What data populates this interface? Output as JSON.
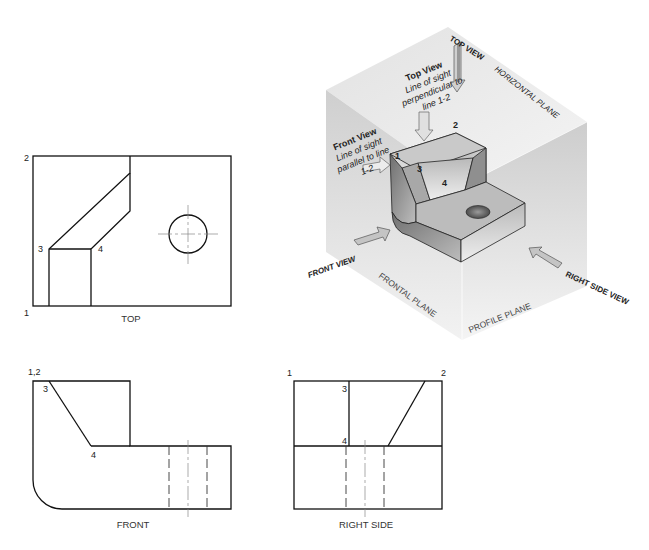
{
  "views": {
    "top": {
      "caption": "TOP",
      "points": {
        "p1": "1",
        "p2": "2",
        "p3": "3",
        "p4": "4"
      }
    },
    "front": {
      "caption": "FRONT",
      "points": {
        "p12": "1,2",
        "p3": "3",
        "p4": "4"
      }
    },
    "right_side": {
      "caption": "RIGHT SIDE",
      "points": {
        "p1": "1",
        "p2": "2",
        "p3": "3",
        "p4": "4"
      }
    }
  },
  "pictorial": {
    "top_view_note": {
      "title": "Top View",
      "lines": [
        "Line of sight",
        "perpendicular to",
        "line 1-2"
      ]
    },
    "front_view_note": {
      "title": "Front View",
      "lines": [
        "Line of sight",
        "parallel to line",
        "1-2"
      ]
    },
    "labels": {
      "top_view": "TOP VIEW",
      "horizontal_plane": "HORIZONTAL PLANE",
      "front_view": "FRONT VIEW",
      "frontal_plane": "FRONTAL PLANE",
      "profile_plane": "PROFILE PLANE",
      "right_side_view": "RIGHT SIDE VIEW"
    },
    "points": {
      "p1": "1",
      "p2": "2",
      "p3": "3",
      "p4": "4"
    }
  },
  "colors": {
    "line": "#111111",
    "plane_light": "#ececec",
    "plane_mid": "#d6d6d6",
    "plane_dark": "#c4c4c4",
    "object_face": "#9a9a9a"
  }
}
